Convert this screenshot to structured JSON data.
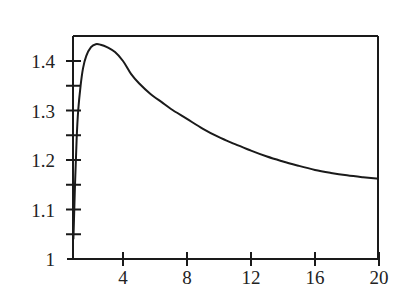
{
  "chart_data": {
    "type": "line",
    "title": "",
    "xlabel": "",
    "ylabel": "",
    "xlim": [
      0.875,
      20
    ],
    "ylim": [
      1.0,
      1.45
    ],
    "grid": false,
    "legend": null,
    "x_ticks": [
      4,
      8,
      12,
      16,
      20
    ],
    "x_tick_labels": [
      "4",
      "8",
      "12",
      "16",
      "20"
    ],
    "y_ticks": [
      1.0,
      1.05,
      1.1,
      1.15,
      1.2,
      1.25,
      1.3,
      1.35,
      1.4
    ],
    "y_tick_labels": [
      "1",
      "",
      "1.1",
      "",
      "1.2",
      "",
      "1.3",
      "",
      "1.4"
    ],
    "series": [
      {
        "name": "curve",
        "color": "#1a1a1a",
        "x": [
          0.9,
          1.0,
          1.1,
          1.2,
          1.35,
          1.5,
          1.7,
          2.0,
          2.3,
          2.6,
          3.0,
          3.5,
          4.0,
          4.5,
          5.0,
          5.7,
          6.5,
          7.0,
          8.0,
          9.0,
          10.0,
          11.0,
          12.0,
          13.0,
          14.0,
          15.0,
          16.0,
          17.0,
          18.0,
          19.0,
          20.0
        ],
        "y": [
          1.04,
          1.15,
          1.24,
          1.3,
          1.35,
          1.385,
          1.41,
          1.428,
          1.434,
          1.433,
          1.428,
          1.418,
          1.4,
          1.374,
          1.355,
          1.334,
          1.315,
          1.303,
          1.283,
          1.263,
          1.246,
          1.232,
          1.219,
          1.207,
          1.197,
          1.188,
          1.18,
          1.174,
          1.169,
          1.165,
          1.162
        ]
      }
    ]
  },
  "axis_labels": {
    "y": [
      "1",
      "1.1",
      "1.2",
      "1.3",
      "1.4"
    ],
    "x": [
      "4",
      "8",
      "12",
      "16",
      "20"
    ]
  }
}
